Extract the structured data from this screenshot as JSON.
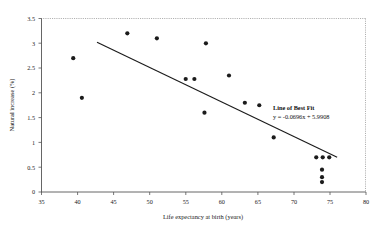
{
  "chart_data": {
    "type": "scatter",
    "title": "",
    "xlabel": "Life expectancy at birth (years)",
    "ylabel": "Natural increase (%)",
    "xlim": [
      35,
      80
    ],
    "ylim": [
      0,
      3.5
    ],
    "xticks": [
      35,
      40,
      45,
      50,
      55,
      60,
      65,
      70,
      75,
      80
    ],
    "yticks": [
      0,
      0.5,
      1,
      1.5,
      2,
      2.5,
      3,
      3.5
    ],
    "xtick_labels": [
      "35",
      "40",
      "45",
      "50",
      "55",
      "60",
      "65",
      "70",
      "75",
      "80"
    ],
    "ytick_labels": [
      "0",
      "0.5",
      "1",
      "1.5",
      "2",
      "2.5",
      "3",
      "3.5"
    ],
    "grid": false,
    "legend_position": "none",
    "points": [
      {
        "x": 39.4,
        "y": 2.7
      },
      {
        "x": 40.6,
        "y": 1.9
      },
      {
        "x": 46.9,
        "y": 3.2
      },
      {
        "x": 51.0,
        "y": 3.1
      },
      {
        "x": 55.0,
        "y": 2.28
      },
      {
        "x": 56.2,
        "y": 2.28
      },
      {
        "x": 57.8,
        "y": 3.0
      },
      {
        "x": 57.6,
        "y": 1.6
      },
      {
        "x": 61.0,
        "y": 2.35
      },
      {
        "x": 63.2,
        "y": 1.8
      },
      {
        "x": 65.2,
        "y": 1.75
      },
      {
        "x": 67.2,
        "y": 1.1
      },
      {
        "x": 73.1,
        "y": 0.7
      },
      {
        "x": 74.0,
        "y": 0.7
      },
      {
        "x": 74.9,
        "y": 0.7
      },
      {
        "x": 73.9,
        "y": 0.45
      },
      {
        "x": 73.9,
        "y": 0.3
      },
      {
        "x": 73.9,
        "y": 0.2
      }
    ],
    "fit_line": {
      "label": "Line of Best Fit",
      "equation": "y = -0.0696x + 5.9908",
      "slope": -0.0696,
      "intercept": 5.9908,
      "x_start": 42.7,
      "x_end": 76.0
    },
    "marker_color": "#1b1b1b",
    "line_color": "#1b1b1b"
  }
}
